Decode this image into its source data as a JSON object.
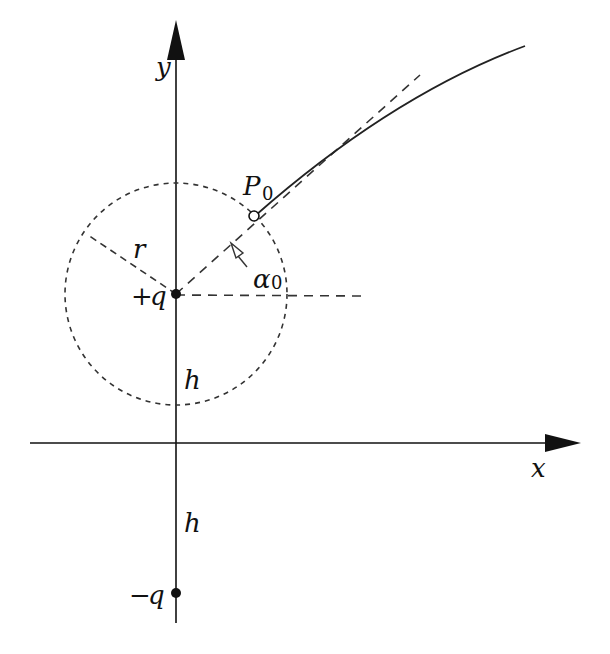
{
  "figure": {
    "type": "physics diagram: charged particle trajectory near image charges",
    "colors": {
      "ink": "#111111",
      "background": "#ffffff"
    }
  },
  "axes": {
    "x_label": "x",
    "y_label": "y"
  },
  "charges": {
    "positive": {
      "label_sign": "+",
      "label_var": "q"
    },
    "negative": {
      "label_sign": "−",
      "label_var": "q"
    }
  },
  "distances": {
    "upper_h": "h",
    "lower_h": "h"
  },
  "circle": {
    "radius_label": "r"
  },
  "point": {
    "label_main": "P",
    "label_sub": "0"
  },
  "angle": {
    "label_main": "α",
    "label_sub": "0"
  }
}
